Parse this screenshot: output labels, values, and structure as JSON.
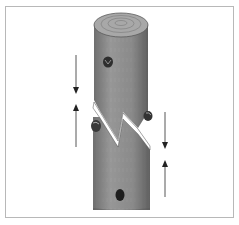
{
  "figure": {
    "elements": {
      "log": {
        "label": "log",
        "color": "#8a8a8a",
        "top_color": "#a3a3a3"
      },
      "fracture": {
        "label": "zigzag-fracture",
        "color": "#ffffff"
      },
      "nodes": [
        {
          "name": "knot-upper",
          "x": 108,
          "y": 62
        },
        {
          "name": "knot-left",
          "x": 96,
          "y": 125
        },
        {
          "name": "knot-right",
          "x": 148,
          "y": 115
        },
        {
          "name": "knot-lower",
          "x": 120,
          "y": 195
        }
      ],
      "arrows": [
        {
          "name": "arrow-left-down",
          "x": 76,
          "y1": 55,
          "y2": 93,
          "direction": "down"
        },
        {
          "name": "arrow-left-up",
          "x": 76,
          "y1": 146,
          "y2": 105,
          "direction": "up"
        },
        {
          "name": "arrow-right-down",
          "x": 165,
          "y1": 112,
          "y2": 148,
          "direction": "down"
        },
        {
          "name": "arrow-right-up",
          "x": 165,
          "y1": 197,
          "y2": 160,
          "direction": "up"
        }
      ],
      "arrow_color": "#444444",
      "frame_color": "#b8b8b8"
    }
  }
}
